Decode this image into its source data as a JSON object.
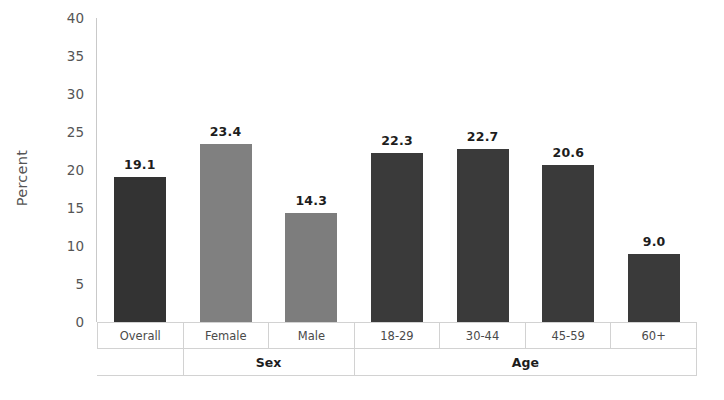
{
  "chart_data": {
    "type": "bar",
    "title": "",
    "subtitle": "",
    "xlabel": "",
    "ylabel": "Percent",
    "ylim": [
      0,
      40
    ],
    "yticks": [
      0,
      5,
      10,
      15,
      20,
      25,
      30,
      35,
      40
    ],
    "ytick_labels": [
      "0",
      "5",
      "10",
      "15",
      "20",
      "25",
      "30",
      "35",
      "40"
    ],
    "grid": false,
    "legend": "none",
    "categories": [
      "Overall",
      "Female",
      "Male",
      "18-29",
      "30-44",
      "45-59",
      "60+"
    ],
    "values": [
      19.1,
      23.4,
      14.3,
      22.3,
      22.7,
      20.6,
      9.0
    ],
    "value_labels": [
      "19.1",
      "23.4",
      "14.3",
      "22.3",
      "22.7",
      "20.6",
      "9.0"
    ],
    "bar_colors": [
      "#333333",
      "#808080",
      "#7d7d7d",
      "#3a3a3a",
      "#3a3a3a",
      "#3a3a3a",
      "#3a3a3a"
    ],
    "groups": [
      {
        "label": "",
        "span": 1
      },
      {
        "label": "Sex",
        "span": 2
      },
      {
        "label": "Age",
        "span": 4
      }
    ],
    "group_labels": [
      "",
      "Sex",
      "Age"
    ]
  },
  "style": {
    "background": "#ffffff",
    "axis_color": "#c9c9c9",
    "tick_text_color": "#555555",
    "table_border": "#d2d2d2",
    "value_label_color": "#1d1d1d"
  }
}
